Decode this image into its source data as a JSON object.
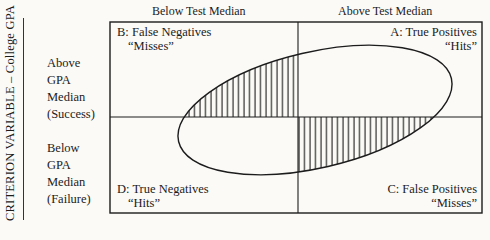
{
  "diagram": {
    "type": "2x2 decision matrix with tilted ellipse scatter",
    "y_axis_label": "CRITERION VARIABLE – College GPA",
    "columns": [
      {
        "label": "Below Test Median"
      },
      {
        "label": "Above Test Median"
      }
    ],
    "rows": [
      {
        "label": "Above\nGPA\nMedian\n(Success)"
      },
      {
        "label": "Below\nGPA\nMedian\n(Failure)"
      }
    ],
    "quadrants": {
      "A": {
        "title": "A: True Positives",
        "tag": "“Hits”"
      },
      "B": {
        "title": "B: False Negatives",
        "tag": "“Misses”"
      },
      "C": {
        "title": "C: False Positives",
        "tag": "“Misses”"
      },
      "D": {
        "title": "D: True Negatives",
        "tag": "“Hits”"
      }
    },
    "hatched_regions": [
      "B (ellipse part in upper-left)",
      "C (ellipse part in lower-right)"
    ],
    "colors": {
      "ink": "#1c1c1c",
      "paper": "#fbfaf7"
    }
  }
}
